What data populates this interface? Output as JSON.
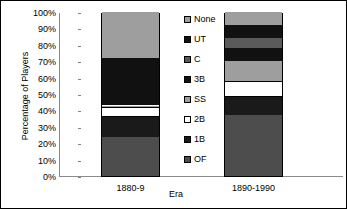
{
  "chart_data": {
    "type": "bar",
    "subtype": "stacked-100-percent",
    "title": "",
    "xlabel": "Era",
    "ylabel": "Percentage of Players",
    "categories": [
      "1880-9",
      "1890-1990"
    ],
    "ytick_labels": [
      "100%",
      "90%",
      "80%",
      "70%",
      "60%",
      "50%",
      "40%",
      "30%",
      "20%",
      "10%",
      "0%"
    ],
    "ytick_values": [
      100,
      90,
      80,
      70,
      60,
      50,
      40,
      30,
      20,
      10,
      0
    ],
    "ylim": [
      0,
      100
    ],
    "grid": false,
    "legend_position": "right",
    "legend_order_top_to_bottom": [
      "None",
      "UT",
      "C",
      "3B",
      "SS",
      "2B",
      "1B",
      "OF"
    ],
    "stack_order_bottom_to_top": [
      "OF",
      "1B",
      "2B",
      "SS",
      "3B",
      "C",
      "UT",
      "None"
    ],
    "series": [
      {
        "name": "OF",
        "color": "#4d4d4d",
        "values": [
          24,
          37
        ]
      },
      {
        "name": "1B",
        "color": "#1a1a1a",
        "values": [
          12,
          11
        ]
      },
      {
        "name": "2B",
        "color": "#ffffff",
        "values": [
          6,
          10
        ]
      },
      {
        "name": "SS",
        "color": "#9e9e9e",
        "values": [
          1,
          12
        ]
      },
      {
        "name": "3B",
        "color": "#111111",
        "values": [
          29,
          8
        ]
      },
      {
        "name": "C",
        "color": "#5a5a5a",
        "values": [
          0,
          6
        ]
      },
      {
        "name": "UT",
        "color": "#111111",
        "values": [
          0,
          8
        ]
      },
      {
        "name": "None",
        "color": "#9e9e9e",
        "values": [
          28,
          8
        ]
      }
    ]
  },
  "axes": {
    "y_title": "Percentage of Players",
    "x_title": "Era"
  },
  "legend": {
    "items": [
      {
        "label": "None",
        "color": "#9e9e9e"
      },
      {
        "label": "UT",
        "color": "#111111"
      },
      {
        "label": "C",
        "color": "#5a5a5a"
      },
      {
        "label": "3B",
        "color": "#111111"
      },
      {
        "label": "SS",
        "color": "#9e9e9e"
      },
      {
        "label": "2B",
        "color": "#ffffff"
      },
      {
        "label": "1B",
        "color": "#1a1a1a"
      },
      {
        "label": "OF",
        "color": "#4d4d4d"
      }
    ]
  }
}
